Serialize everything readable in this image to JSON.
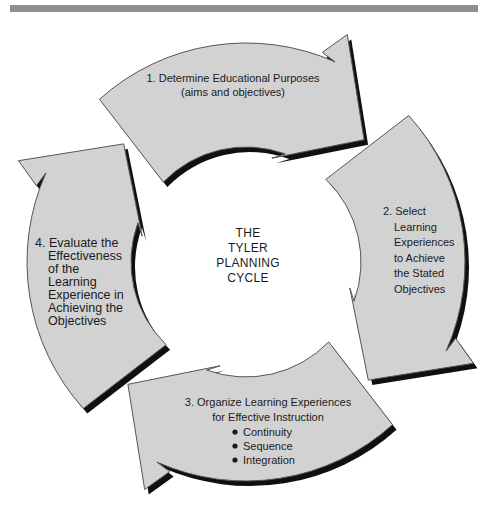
{
  "diagram": {
    "center": {
      "lines": [
        "THE",
        "TYLER",
        "PLANNING",
        "CYCLE"
      ]
    },
    "steps": [
      {
        "id": "step-1",
        "lines": [
          "1. Determine Educational Purposes",
          "(aims and objectives)"
        ]
      },
      {
        "id": "step-2",
        "lines": [
          "2. Select",
          "Learning",
          "Experiences",
          "to Achieve",
          "the Stated",
          "Objectives"
        ]
      },
      {
        "id": "step-3",
        "lines": [
          "3. Organize Learning Experiences",
          "for Effective Instruction"
        ],
        "bullets": [
          "Continuity",
          "Sequence",
          "Integration"
        ]
      },
      {
        "id": "step-4",
        "lines": [
          "4. Evaluate the",
          "Effectiveness",
          "of the",
          "Learning",
          "Experience in",
          "Achieving the",
          "Objectives"
        ]
      }
    ],
    "colors": {
      "arrow_fill": "#d2d2d2",
      "arrow_outline": "#555555",
      "arrow_shadow": "#101010",
      "text": "#1b1b1b",
      "top_bar": "#8f8f8f",
      "background": "#ffffff"
    }
  }
}
